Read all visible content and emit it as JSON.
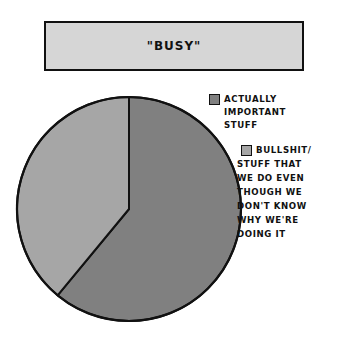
{
  "chart_data": {
    "type": "pie",
    "title": "\"BUSY\"",
    "categories": [
      "ACTUALLY IMPORTANT STUFF",
      "BULLSHIT/ STUFF THAT WE DO EVEN THOUGH WE DON'T KNOW WHY WE'RE DOING IT"
    ],
    "values": [
      61,
      39
    ],
    "colors": [
      "#808080",
      "#a6a6a6"
    ],
    "legend_position": "right",
    "start_angle_deg": 0,
    "direction": "clockwise"
  },
  "title": "\"BUSY\"",
  "legend": {
    "items": [
      {
        "lines": [
          "ACTUALLY",
          "IMPORTANT",
          "STUFF"
        ],
        "color": "#808080"
      },
      {
        "lines": [
          "BULLSHIT/",
          "STUFF THAT",
          "WE DO EVEN",
          "THOUGH WE",
          "DON'T KNOW",
          "WHY WE'RE",
          "DOING IT"
        ],
        "color": "#a6a6a6"
      }
    ]
  }
}
